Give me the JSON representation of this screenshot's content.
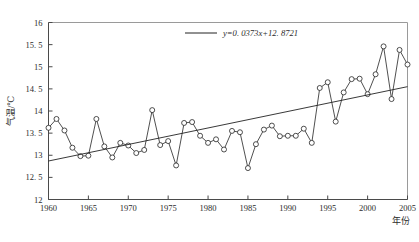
{
  "chart_data": {
    "type": "line",
    "title": "",
    "xlabel": "年份",
    "ylabel": "气温/℃",
    "xlim": [
      1960,
      2005
    ],
    "ylim": [
      12,
      16
    ],
    "xticks": [
      1960,
      1965,
      1970,
      1975,
      1980,
      1985,
      1990,
      1995,
      2000,
      2005
    ],
    "yticks": [
      12,
      12.5,
      13,
      13.5,
      14,
      14.5,
      15,
      15.5,
      16
    ],
    "ytick_labels": [
      "12",
      "12. 5",
      "13",
      "13. 5",
      "14",
      "14. 5",
      "15",
      "15. 5",
      "16"
    ],
    "grid": false,
    "legend_position": "top-center",
    "legend": [
      {
        "label": "y=0. 0373x+12. 8721",
        "marker": "line",
        "color": "#232323"
      }
    ],
    "series": [
      {
        "name": "年平均气温",
        "marker": "open-circle",
        "color": "#232323",
        "x": [
          1960,
          1961,
          1962,
          1963,
          1964,
          1965,
          1966,
          1967,
          1968,
          1969,
          1970,
          1971,
          1972,
          1973,
          1974,
          1975,
          1976,
          1977,
          1978,
          1979,
          1980,
          1981,
          1982,
          1983,
          1984,
          1985,
          1986,
          1987,
          1988,
          1989,
          1990,
          1991,
          1992,
          1993,
          1994,
          1995,
          1996,
          1997,
          1998,
          1999,
          2000,
          2001,
          2002,
          2003,
          2004,
          2005
        ],
        "values": [
          13.62,
          13.82,
          13.56,
          13.17,
          12.98,
          12.99,
          13.82,
          13.2,
          12.95,
          13.28,
          13.22,
          13.05,
          13.12,
          14.02,
          13.23,
          13.32,
          12.77,
          13.73,
          13.75,
          13.44,
          13.28,
          13.36,
          13.13,
          13.55,
          13.52,
          12.71,
          13.25,
          13.58,
          13.67,
          13.43,
          13.44,
          13.44,
          13.6,
          13.28,
          14.52,
          14.65,
          13.76,
          14.42,
          14.72,
          14.73,
          14.38,
          14.83,
          15.46,
          14.27,
          15.38,
          15.05
        ]
      }
    ],
    "trendline": {
      "equation": "y=0. 0373x+12. 8721",
      "slope": 0.0373,
      "intercept": 12.8721,
      "x_start": 1960,
      "x_end": 2005,
      "y_start": 12.87,
      "y_end": 14.55
    }
  }
}
